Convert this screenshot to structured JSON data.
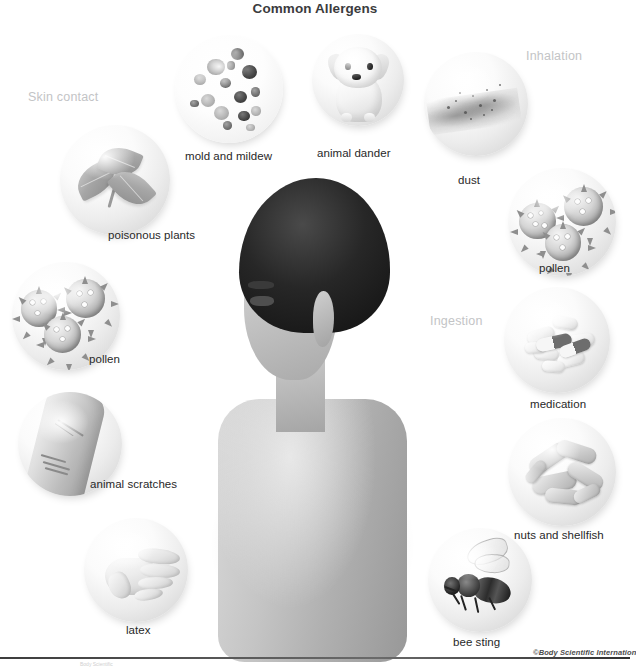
{
  "figure": {
    "title": "Common Allergens",
    "credit": "©Body Scientific Internation",
    "credit_sub": "Body Scientific",
    "central_subject": "boy-profile-illustration",
    "background_color": "#ffffff",
    "title_color": "#3b3b3d",
    "label_color": "#282828",
    "category_color": "#c3c4c6"
  },
  "categories": [
    {
      "id": "skin-contact",
      "label": "Skin contact"
    },
    {
      "id": "inhalation",
      "label": "Inhalation"
    },
    {
      "id": "ingestion",
      "label": "Ingestion"
    },
    {
      "id": "injection",
      "label": "Injection"
    }
  ],
  "allergens": [
    {
      "id": "mold",
      "label": "mold and mildew",
      "category": "inhalation",
      "icon": "mold-spores-icon"
    },
    {
      "id": "animal-dander",
      "label": "animal dander",
      "category": "inhalation",
      "icon": "puppy-icon"
    },
    {
      "id": "dust",
      "label": "dust",
      "category": "inhalation",
      "icon": "dust-cloud-icon"
    },
    {
      "id": "pollen-right",
      "label": "pollen",
      "category": "inhalation",
      "icon": "pollen-grains-icon"
    },
    {
      "id": "poisonous-plants",
      "label": "poisonous plants",
      "category": "skin-contact",
      "icon": "poison-ivy-leaf-icon"
    },
    {
      "id": "pollen-left",
      "label": "pollen",
      "category": "skin-contact",
      "icon": "pollen-grains-icon"
    },
    {
      "id": "animal-scratches",
      "label": "animal scratches",
      "category": "skin-contact",
      "icon": "scratched-arm-icon"
    },
    {
      "id": "latex",
      "label": "latex",
      "category": "skin-contact",
      "icon": "gloved-hand-icon"
    },
    {
      "id": "medication",
      "label": "medication",
      "category": "ingestion",
      "icon": "pills-icon"
    },
    {
      "id": "nuts-shellfish",
      "label": "nuts and shellfish",
      "category": "ingestion",
      "icon": "peanuts-icon"
    },
    {
      "id": "bee-sting",
      "label": "bee sting",
      "category": "injection",
      "icon": "bee-icon"
    }
  ]
}
